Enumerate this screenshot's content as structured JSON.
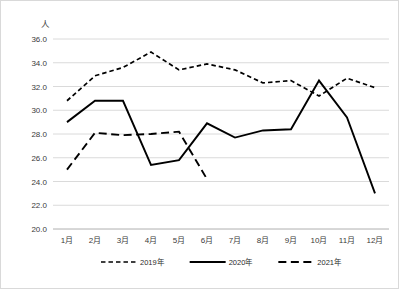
{
  "chart_data": {
    "type": "line",
    "title": "",
    "xlabel": "",
    "ylabel": "人",
    "unit_label": "人",
    "grid": true,
    "legend_position": "bottom",
    "ylim": [
      20.0,
      36.0
    ],
    "ytick_step": 2.0,
    "categories": [
      "1月",
      "2月",
      "3月",
      "4月",
      "5月",
      "6月",
      "7月",
      "8月",
      "9月",
      "10月",
      "11月",
      "12月"
    ],
    "ytick_labels": [
      "36.0",
      "34.0",
      "32.0",
      "30.0",
      "28.0",
      "26.0",
      "24.0",
      "22.0",
      "20.0"
    ],
    "ytick_values": [
      36.0,
      34.0,
      32.0,
      30.0,
      28.0,
      26.0,
      24.0,
      22.0,
      20.0
    ],
    "series": [
      {
        "name": "2019年",
        "style": "dashed-short",
        "color": "#000000",
        "values": [
          30.8,
          32.9,
          33.6,
          34.9,
          33.4,
          33.9,
          33.4,
          32.3,
          32.5,
          31.2,
          32.7,
          31.9
        ]
      },
      {
        "name": "2020年",
        "style": "solid",
        "color": "#000000",
        "values": [
          29.0,
          30.8,
          30.8,
          25.4,
          25.8,
          28.9,
          27.7,
          28.3,
          28.4,
          32.5,
          29.4,
          23.0
        ]
      },
      {
        "name": "2021年",
        "style": "dashed-long",
        "color": "#000000",
        "values": [
          25.0,
          28.1,
          27.9,
          28.0,
          28.2,
          24.2,
          null,
          null,
          null,
          null,
          null,
          null
        ]
      }
    ]
  },
  "legend": {
    "items": [
      {
        "label": "2019年"
      },
      {
        "label": "2020年"
      },
      {
        "label": "2021年"
      }
    ]
  },
  "colors": {
    "series": "#000000",
    "grid": "#d0d0d0",
    "border": "#d9d9d9",
    "text": "#3b3b3b"
  }
}
